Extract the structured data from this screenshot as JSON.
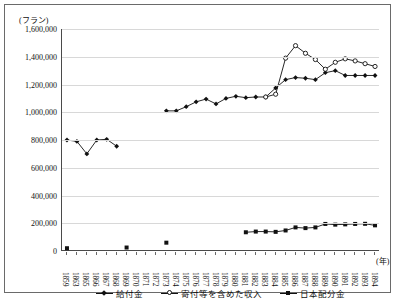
{
  "chart_data": {
    "type": "line",
    "title": "",
    "xlabel": "(年)",
    "ylabel": "(フラン)",
    "ylim": [
      0,
      1600000
    ],
    "ytick_step": 200000,
    "ytick_labels": [
      "0",
      "200,000",
      "400,000",
      "600,000",
      "800,000",
      "1,000,000",
      "1,200,000",
      "1,400,000",
      "1,600,000"
    ],
    "ytick_values": [
      0,
      200000,
      400000,
      600000,
      800000,
      1000000,
      1200000,
      1400000,
      1600000
    ],
    "grid": true,
    "legend_position": "bottom",
    "categories": [
      "1859",
      "1863",
      "1865",
      "1866",
      "1867",
      "1868",
      "1869",
      "1870",
      "1871",
      "1872",
      "1873",
      "1874",
      "1875",
      "1876",
      "1877",
      "1878",
      "1879",
      "1880",
      "1881",
      "1882",
      "1883",
      "1884",
      "1885",
      "1886",
      "1887",
      "1888",
      "1889",
      "1890",
      "1891",
      "1892",
      "1893",
      "1894"
    ],
    "series": [
      {
        "name": "給付金",
        "marker": "filled-diamond",
        "values": [
          800000,
          790000,
          700000,
          800000,
          805000,
          755000,
          null,
          null,
          null,
          null,
          1010000,
          1010000,
          1040000,
          1075000,
          1095000,
          1060000,
          1100000,
          1115000,
          1105000,
          1110000,
          1110000,
          1175000,
          1235000,
          1250000,
          1245000,
          1235000,
          1285000,
          1300000,
          1265000,
          1265000,
          1265000,
          1265000
        ]
      },
      {
        "name": "寄付等を含めた収入",
        "marker": "open-circle",
        "values": [
          null,
          null,
          null,
          null,
          null,
          null,
          null,
          null,
          null,
          null,
          null,
          null,
          null,
          null,
          null,
          null,
          null,
          null,
          null,
          null,
          1110000,
          1130000,
          1390000,
          1480000,
          1425000,
          1380000,
          1310000,
          1360000,
          1385000,
          1370000,
          1350000,
          1330000
        ]
      },
      {
        "name": "日本配分金",
        "marker": "filled-square",
        "values": [
          20000,
          null,
          null,
          null,
          null,
          null,
          25000,
          null,
          null,
          null,
          60000,
          null,
          null,
          null,
          null,
          null,
          null,
          null,
          135000,
          140000,
          140000,
          138000,
          148000,
          170000,
          165000,
          170000,
          195000,
          190000,
          192000,
          195000,
          196000,
          185000
        ]
      }
    ]
  }
}
